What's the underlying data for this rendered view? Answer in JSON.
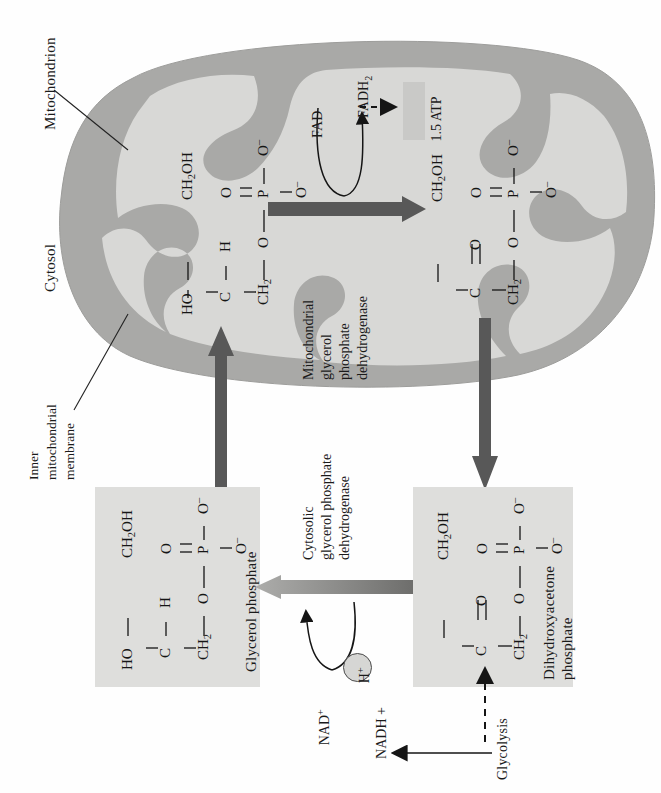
{
  "figure": {
    "orientation": "rotated-90-ccw"
  },
  "colors": {
    "mito_outer": "#a9a9a7",
    "mito_matrix": "#d8d8d6",
    "box_fill": "#dededc",
    "dark_arrow": "#585858",
    "gray_arrow": "#9a9a98",
    "badge_fill": "#c9c9c7",
    "stroke": "#222222",
    "hplus_fill": "#d6d6d4"
  },
  "labels": {
    "mitochondrion": "Mitochondrion",
    "cytosol": "Cytosol",
    "inner_membrane_l1": "Inner",
    "inner_membrane_l2": "mitochondrial",
    "inner_membrane_l3": "membrane"
  },
  "enzymes": {
    "mitochondrial": {
      "l1": "Mitochondrial",
      "l2": "glycerol",
      "l3": "phosphate",
      "l4": "dehydrogenase"
    },
    "cytosolic": {
      "l1": "Cytosolic",
      "l2": "glycerol phosphate",
      "l3": "dehydrogenase"
    }
  },
  "cofactors": {
    "fad": "FAD",
    "fadh2_base": "FADH",
    "fadh2_sub": "2",
    "atp_yield": "1.5 ATP",
    "nad_base": "NAD",
    "nad_sup": "+",
    "nadh": "NADH +",
    "hplus_base": "H",
    "hplus_sup": "+",
    "glycolysis": "Glycolysis"
  },
  "molecules": {
    "glycerol_phosphate": {
      "name": "Glycerol phosphate",
      "atoms": {
        "ch2oh": "CH",
        "ch2oh_sub": "2",
        "ch2oh_tail": "OH",
        "ho": "HO",
        "c": "C",
        "h": "H",
        "ch2": "CH",
        "ch2_sub": "2",
        "o_link": "O",
        "p": "P",
        "o_double": "O",
        "o_minus_top": "O",
        "o_minus_right": "O",
        "minus": "–"
      }
    },
    "dihydroxyacetone_phosphate": {
      "name_l1": "Dihydroxyacetone",
      "name_l2": "phosphate",
      "atoms": {
        "ch2oh": "CH",
        "ch2oh_sub": "2",
        "ch2oh_tail": "OH",
        "c": "C",
        "o_keto": "O",
        "ch2": "CH",
        "ch2_sub": "2",
        "o_link": "O",
        "p": "P",
        "o_double": "O",
        "o_minus_top": "O",
        "o_minus_right": "O"
      }
    }
  }
}
